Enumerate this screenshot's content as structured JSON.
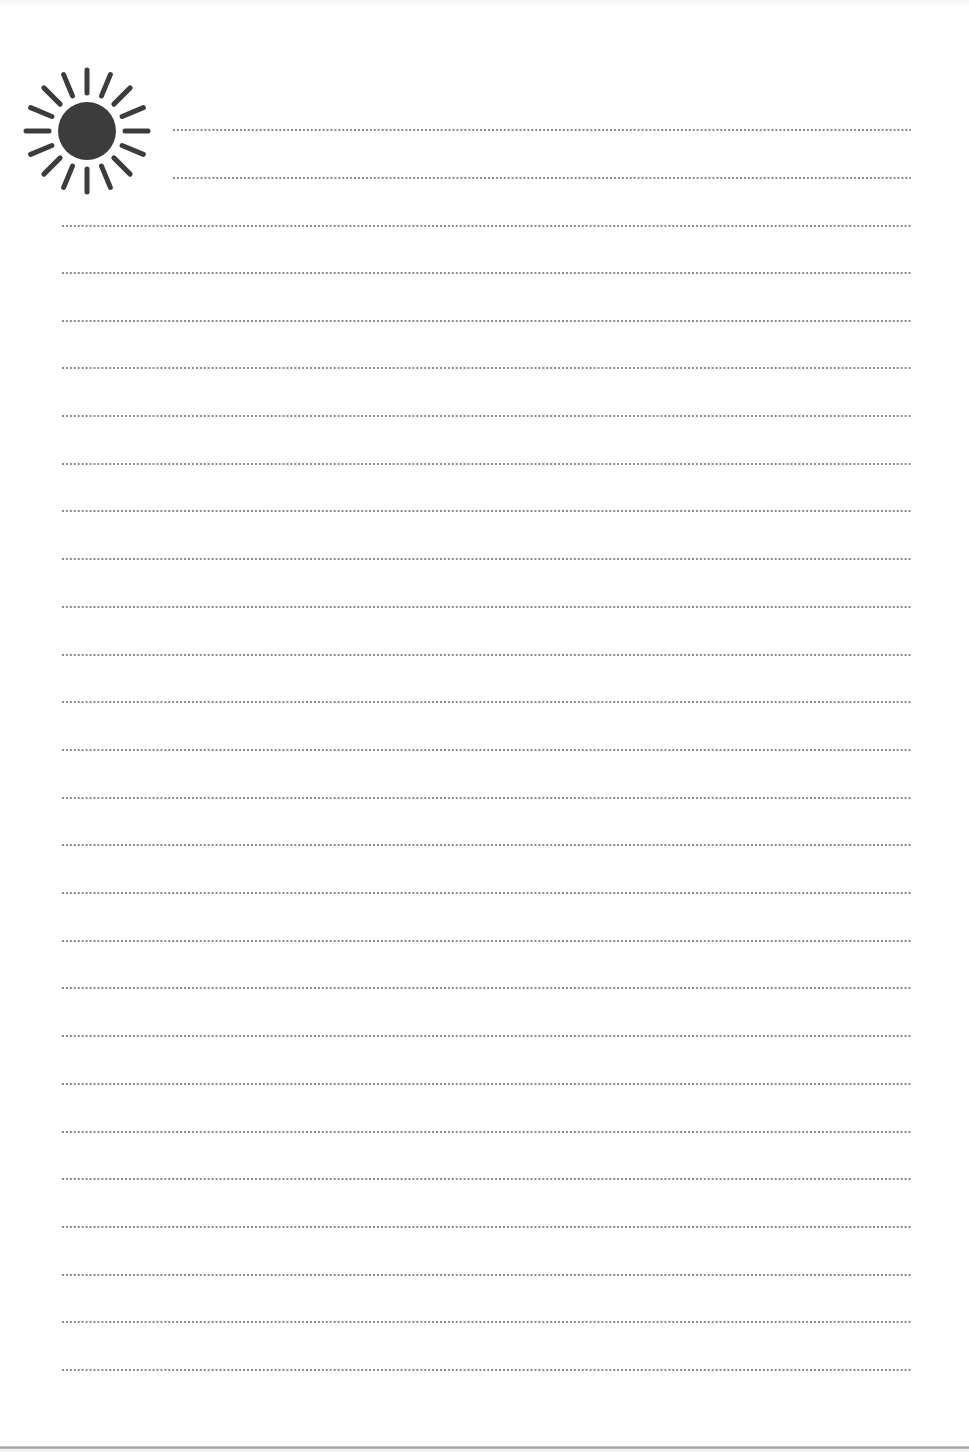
{
  "page": {
    "type": "lined-notepaper",
    "background_color": "#ffffff",
    "ink_color": "#3c3c3c",
    "dot_color": "#8a8a8a"
  },
  "header_icon": {
    "icon": "sun-icon",
    "ray_count": 16,
    "center": [
      87,
      131
    ],
    "core_radius": 29,
    "ray_inner_radius": 38,
    "ray_outer_radius": 61
  },
  "rules": {
    "style": "dotted",
    "right_edge_x": 911,
    "short_rule_left_x": 172,
    "full_rule_left_x": 61,
    "short_rules_y": [
      130,
      178
    ],
    "full_rules_y": [
      226,
      273,
      321,
      368,
      416,
      464,
      511,
      559,
      607,
      655,
      702,
      750,
      798,
      845,
      893,
      941,
      988,
      1036,
      1084,
      1132,
      1179,
      1227,
      1275,
      1322,
      1370
    ],
    "total_count": 27
  }
}
